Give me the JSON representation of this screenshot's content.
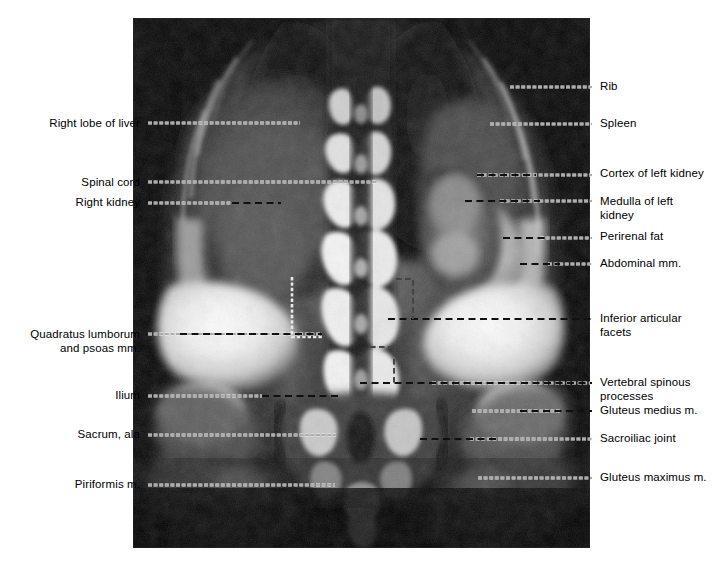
{
  "figure": {
    "type": "annotated-mri-coronal-abdomen",
    "plate": {
      "x": 133,
      "y": 18,
      "width": 457,
      "height": 530,
      "background": "#000000"
    },
    "canvas": {
      "width": 718,
      "height": 567,
      "background": "#ffffff"
    },
    "colors": {
      "page_background": "#ffffff",
      "plate_background": "#000000",
      "label_text": "#000000",
      "bead_leader": "#f2f2f2",
      "dash_leader": "#101010"
    }
  },
  "labels": {
    "left": [
      {
        "id": "right-lobe-of-liver",
        "text": "Right lobe of liver",
        "x_right": 140,
        "y_baseline": 127,
        "lines": 1
      },
      {
        "id": "spinal-cord",
        "text": "Spinal cord",
        "x_right": 140,
        "y_baseline": 186,
        "lines": 1
      },
      {
        "id": "right-kidney",
        "text": "Right kidney",
        "x_right": 140,
        "y_baseline": 206,
        "lines": 1
      },
      {
        "id": "quadratus-lumborum-psoas",
        "text": "Quadratus lumborum\nand psoas mm.",
        "x_right": 140,
        "y_baseline": 338,
        "lines": 2
      },
      {
        "id": "ilium",
        "text": "Ilium",
        "x_right": 140,
        "y_baseline": 399,
        "lines": 1
      },
      {
        "id": "sacrum-ala",
        "text": "Sacrum, ala",
        "x_right": 140,
        "y_baseline": 438,
        "lines": 1
      },
      {
        "id": "piriformis-m",
        "text": "Piriformis m.",
        "x_right": 140,
        "y_baseline": 488,
        "lines": 1
      }
    ],
    "right": [
      {
        "id": "rib",
        "text": "Rib",
        "x_left": 600,
        "y_baseline": 90,
        "lines": 1
      },
      {
        "id": "spleen",
        "text": "Spleen",
        "x_left": 600,
        "y_baseline": 127,
        "lines": 1
      },
      {
        "id": "cortex-of-left-kidney",
        "text": "Cortex of left kidney",
        "x_left": 600,
        "y_baseline": 177,
        "lines": 1
      },
      {
        "id": "medulla-of-left-kidney",
        "text": "Medulla of left\n  kidney",
        "x_left": 600,
        "y_baseline": 205,
        "lines": 2
      },
      {
        "id": "perirenal-fat",
        "text": "Perirenal fat",
        "x_left": 600,
        "y_baseline": 240,
        "lines": 1
      },
      {
        "id": "abdominal-mm",
        "text": "Abdominal mm.",
        "x_left": 600,
        "y_baseline": 267,
        "lines": 1
      },
      {
        "id": "inferior-articular-facets",
        "text": "Inferior articular\n  facets",
        "x_left": 600,
        "y_baseline": 322,
        "lines": 2
      },
      {
        "id": "vertebral-spinous-processes",
        "text": "Vertebral spinous\n  processes",
        "x_left": 600,
        "y_baseline": 386,
        "lines": 2
      },
      {
        "id": "gluteus-medius-m",
        "text": "Gluteus medius m.",
        "x_left": 600,
        "y_baseline": 414,
        "lines": 1
      },
      {
        "id": "sacroiliac-joint",
        "text": "Sacroiliac joint",
        "x_left": 600,
        "y_baseline": 442,
        "lines": 1
      },
      {
        "id": "gluteus-maximus-m",
        "text": "Gluteus maximus m.",
        "x_left": 600,
        "y_baseline": 481,
        "lines": 1
      }
    ]
  },
  "leaders": [
    {
      "id": "leader-right-lobe-of-liver",
      "style": "bead",
      "path": "M148,123 L300,123"
    },
    {
      "id": "leader-spinal-cord",
      "style": "bead",
      "path": "M148,182 L378,182"
    },
    {
      "id": "leader-right-kidney",
      "style": "bead-dash",
      "bead": "M148,203 L232,203",
      "dash": "M232,203 L281,203"
    },
    {
      "id": "leader-quadratus-lumborum-psoas",
      "style": "bead-dash",
      "bead": "M148,334 L322,334",
      "dash": "M180,334 L322,334"
    },
    {
      "id": "leader-ilium",
      "style": "bead-dash",
      "bead": "M148,396 L262,396",
      "dash": "M262,396 L338,396"
    },
    {
      "id": "leader-sacrum-ala",
      "style": "bead",
      "path": "M148,435 L336,435"
    },
    {
      "id": "leader-piriformis-m",
      "style": "bead",
      "path": "M148,485 L335,485"
    },
    {
      "id": "leader-rib",
      "style": "bead",
      "path": "M510,87 L592,87"
    },
    {
      "id": "leader-spleen",
      "style": "bead",
      "path": "M490,124 L592,124"
    },
    {
      "id": "leader-cortex-of-left-kidney",
      "style": "dash-bead",
      "dash": "M477,175 L536,175",
      "bead": "M477,175 L592,175"
    },
    {
      "id": "leader-medulla-of-left-kidney",
      "style": "dash-bead",
      "dash": "M465,201 L540,201",
      "bead": "M500,201 L592,201"
    },
    {
      "id": "leader-perirenal-fat",
      "style": "dash-bead",
      "dash": "M503,238 L548,238",
      "bead": "M540,238 L592,238"
    },
    {
      "id": "leader-abdominal-mm",
      "style": "dash-bead",
      "dash": "M520,264 L560,264",
      "bead": "M548,264 L592,264"
    },
    {
      "id": "leader-inferior-articular-facets",
      "style": "elbow-dash",
      "path": "M396,279 L413,279 L413,319 L592,319"
    },
    {
      "id": "leader-inferior-articular-facets-2",
      "style": "dash",
      "path": "M388,319 L592,319"
    },
    {
      "id": "leader-vertebral-spinous-processes",
      "style": "elbow-dash",
      "path": "M370,347 L394,347 L394,383 L592,383"
    },
    {
      "id": "leader-vertebral-spinous-2",
      "style": "dash-bead",
      "dash": "M360,383 L592,383",
      "bead": "M432,383 L592,383"
    },
    {
      "id": "leader-gluteus-medius-m",
      "style": "bead-dash",
      "bead": "M472,411 L560,411",
      "dash": "M520,411 L592,411"
    },
    {
      "id": "leader-sacroiliac-joint",
      "style": "dash-bead",
      "dash": "M420,439 L500,439",
      "bead": "M470,439 L592,439"
    },
    {
      "id": "leader-gluteus-maximus-m",
      "style": "bead",
      "path": "M478,478 L592,478"
    },
    {
      "id": "leader-quadratus-elbow",
      "style": "elbow-bead",
      "path": "M292,277 L292,337 L322,337"
    }
  ],
  "mri": {
    "description": "Coronal T1 MRI of the abdomen and pelvis showing liver, kidneys, spleen, lumbar spine, ilia, sacrum and gluteal muscles",
    "modality": "MRI",
    "plane": "coronal"
  }
}
